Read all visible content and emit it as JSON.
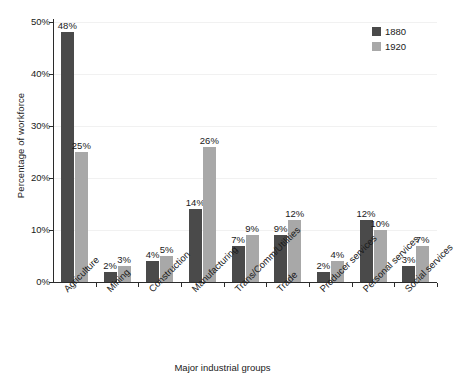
{
  "chart_data": {
    "type": "bar",
    "title": "",
    "xlabel": "Major industrial groups",
    "ylabel": "Percentage of workforce",
    "categories": [
      "Agriculture",
      "Mining",
      "Construction",
      "Manufacturing",
      "Trans/Comm/Utilities",
      "Trade",
      "Producer services",
      "Personal services",
      "Social services"
    ],
    "series": [
      {
        "name": "1880",
        "color": "#4a4a4a",
        "values": [
          48,
          2,
          4,
          14,
          7,
          9,
          2,
          12,
          3
        ],
        "labels": [
          "48%",
          "2%",
          "4%",
          "14%",
          "7%",
          "9%",
          "2%",
          "12%",
          "3%"
        ]
      },
      {
        "name": "1920",
        "color": "#a8a8a8",
        "values": [
          25,
          3,
          5,
          26,
          9,
          12,
          4,
          10,
          7
        ],
        "labels": [
          "25%",
          "3%",
          "5%",
          "26%",
          "9%",
          "12%",
          "4%",
          "10%",
          "7%"
        ]
      }
    ],
    "ylim": [
      0,
      50
    ],
    "yticks": [
      0,
      10,
      20,
      30,
      40,
      50
    ],
    "ytick_labels": [
      "0%",
      "10%",
      "20%",
      "30%",
      "40%",
      "50%"
    ],
    "grid": true,
    "grid_axis": "y",
    "legend_position": "top-right",
    "value_labels": true
  },
  "legend": {
    "entries": [
      {
        "label": "1880",
        "color": "#4a4a4a"
      },
      {
        "label": "1920",
        "color": "#a8a8a8"
      }
    ]
  },
  "axis_titles": {
    "x": "Major industrial groups",
    "y": "Percentage of workforce"
  }
}
